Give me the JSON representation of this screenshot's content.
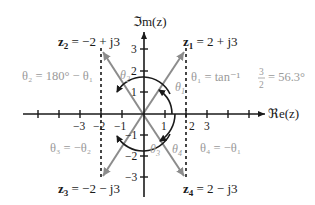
{
  "axes": {
    "x_label": "ℜe(z)",
    "y_label": "ℑm(z)",
    "x_ticks": [
      "−3",
      "−2",
      "−1",
      "1",
      "2",
      "3"
    ],
    "y_ticks": [
      "3",
      "2",
      "1",
      "−1",
      "−2",
      "−3"
    ]
  },
  "points": [
    {
      "id": "z1",
      "label": "z",
      "sub": "1",
      "expr": " = 2 + j3",
      "re": 2,
      "im": 3
    },
    {
      "id": "z2",
      "label": "z",
      "sub": "2",
      "expr": " = −2 + j3",
      "re": -2,
      "im": 3
    },
    {
      "id": "z3",
      "label": "z",
      "sub": "3",
      "expr": " = −2 − j3",
      "re": -2,
      "im": -3
    },
    {
      "id": "z4",
      "label": "z",
      "sub": "4",
      "expr": " = 2 − j3",
      "re": 2,
      "im": -3
    }
  ],
  "angles": {
    "theta1": {
      "label": "θ",
      "sub": "1",
      "formula": "θ₁ = tan⁻¹",
      "frac_num": "3",
      "frac_den": "2",
      "result": "= 56.3°"
    },
    "theta2": {
      "label": "θ",
      "sub": "2",
      "formula": "θ₂ = 180° − θ₁"
    },
    "theta3": {
      "label": "θ",
      "sub": "3",
      "formula": "θ₃ = −θ₂"
    },
    "theta4": {
      "label": "θ",
      "sub": "4",
      "formula": "θ₄ = −θ₁"
    }
  },
  "colors": {
    "axis": "#1a1a1a",
    "vector": "#8c8c8c",
    "formula_text": "#9a9a9a",
    "point_text": "#1a1a1a"
  }
}
